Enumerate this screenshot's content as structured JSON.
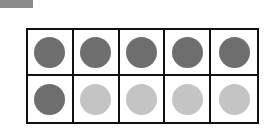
{
  "ten_frame": {
    "rows": 2,
    "columns": 5,
    "filled_count": 6,
    "empty_count": 4,
    "colors": {
      "filled": "#6e6e6e",
      "empty": "#c4c4c4",
      "border": "#111111",
      "tag": "#8a8a8a"
    },
    "cells": [
      "filled",
      "filled",
      "filled",
      "filled",
      "filled",
      "filled",
      "empty",
      "empty",
      "empty",
      "empty"
    ]
  }
}
